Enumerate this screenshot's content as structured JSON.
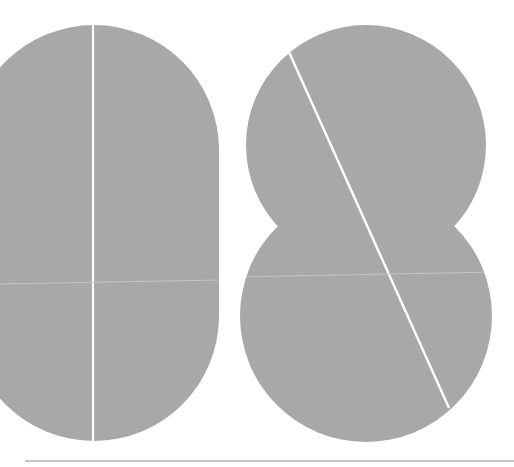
{
  "figure": {
    "title": "Geometric composition: split pill shape and interlocking split circles",
    "background_color": "#ffffff",
    "shape_color": "#a8a8a8",
    "split_line_color": "#ffffff",
    "seam_color": "#c4c4c4",
    "baseline_color": "#8c8c8c"
  },
  "shapes": {
    "pill": {
      "label": "Vertical pill shape split by a vertical line",
      "x": -31,
      "y": 25,
      "width": 250,
      "height": 416,
      "split_x": 93
    },
    "upper_circle": {
      "label": "Upper circle",
      "cx": 366,
      "cy": 145,
      "r": 120
    },
    "lower_circle": {
      "label": "Lower circle",
      "cx": 366,
      "cy": 316,
      "r": 126
    },
    "diagonal_split": {
      "label": "Diagonal split line across circles",
      "x1": 289,
      "y1": 52,
      "x2": 449,
      "y2": 408
    },
    "horizontal_seam": {
      "label": "Faint horizontal seam",
      "x1": 0,
      "y1": 284,
      "x2": 492,
      "y2": 272
    },
    "baseline": {
      "label": "Baseline rule",
      "x1": 25,
      "y1": 461,
      "x2": 514,
      "y2": 461
    }
  }
}
